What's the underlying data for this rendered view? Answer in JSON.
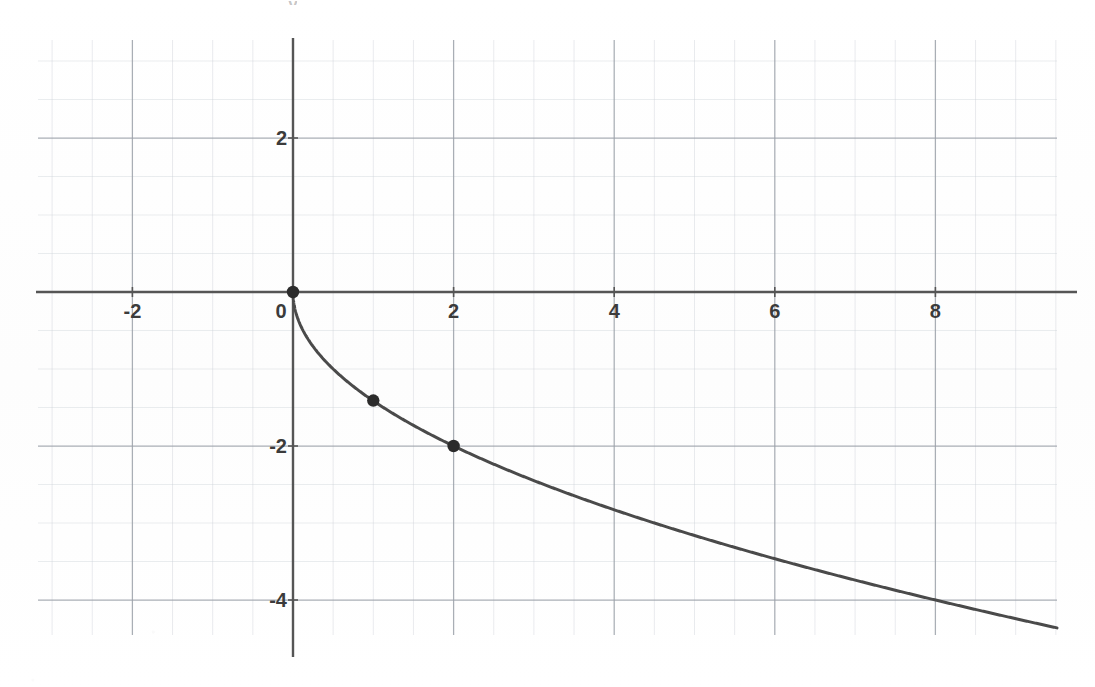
{
  "figure": {
    "width": 1095,
    "height": 687,
    "background_color": "#ffffff",
    "axis_label_y": "y"
  },
  "style": {
    "curve_color": "#4a4a4a",
    "point_color": "#2b2b2b",
    "axis_color": "#555555",
    "major_grid_color": "#9aa0a8",
    "minor_grid_color": "#c9cfd6",
    "tick_label_color": "#3b3b3b"
  },
  "chart_data": {
    "type": "line",
    "title": "",
    "subtitle": "",
    "xlabel": "",
    "ylabel": "y",
    "equation": "y = -sqrt(2x)",
    "function_description": "negative square root curve, reflected across the x-axis",
    "domain": "x >= 0",
    "xlim": [
      -3.2,
      9.6
    ],
    "ylim": [
      -5.1,
      3.3
    ],
    "grid": true,
    "grid_major_step": 2,
    "grid_minor_step": 0.5,
    "legend": "none",
    "legend_position": "none",
    "x_tick_labels": [
      "-2",
      "0",
      "2",
      "4",
      "6",
      "8"
    ],
    "x_tick_values": [
      -2,
      0,
      2,
      4,
      6,
      8
    ],
    "y_tick_labels": [
      "2",
      "-2",
      "-4"
    ],
    "y_tick_values": [
      2,
      -2,
      -4
    ],
    "series": [
      {
        "name": "y = -sqrt(2x)",
        "x": [
          0,
          0.1,
          0.2,
          0.3,
          0.5,
          0.75,
          1,
          1.5,
          2,
          2.5,
          3,
          4,
          5,
          6,
          7,
          8,
          9,
          9.6
        ],
        "values": [
          0,
          -0.45,
          -0.63,
          -0.77,
          -1.0,
          -1.22,
          -1.41,
          -1.73,
          -2.0,
          -2.24,
          -2.45,
          -2.83,
          -3.16,
          -3.46,
          -3.74,
          -4.0,
          -4.24,
          -4.38
        ]
      }
    ],
    "marked_points": [
      {
        "label": "(0, 0)",
        "x": 0,
        "y": 0
      },
      {
        "label": "(1, -1.41)",
        "x": 1,
        "y": -1.41
      },
      {
        "label": "(2, -2)",
        "x": 2,
        "y": -2
      }
    ]
  }
}
